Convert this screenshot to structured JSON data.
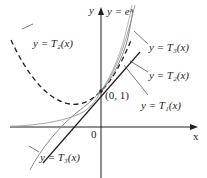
{
  "figure": {
    "title": "",
    "axes": {
      "x_label": "x",
      "y_label": "y",
      "origin_label": "0",
      "point_label": "(0, 1)"
    },
    "curves": [
      {
        "id": "exp",
        "label": "y = eˣ",
        "style": "thin double gray"
      },
      {
        "id": "T1",
        "label": "y = T₁(x)",
        "style": "solid black line"
      },
      {
        "id": "T2",
        "label": "y = T₂(x)",
        "style": "dashed black"
      },
      {
        "id": "T3",
        "label": "y = T₃(x)",
        "style": "solid gray"
      }
    ],
    "labels": {
      "ex": "y = eˣ",
      "T2_left": "y = T₂(x)",
      "T3_right": "y = T₃(x)",
      "T2_right": "y = T₂(x)",
      "T1_right": "y = T₁(x)",
      "T3_bottom": "y = T₃(x)"
    },
    "colors": {
      "axis": "#231f20",
      "exp": "#8a8a8a",
      "T1": "#231f20",
      "T2": "#231f20",
      "T3": "#8a8a8a"
    }
  }
}
